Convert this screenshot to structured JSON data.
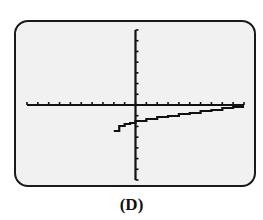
{
  "figure": {
    "caption": "(D)",
    "screen_background": "#f1f1f1",
    "frame_color": "#1a1a1a",
    "ink_color": "#111111"
  },
  "chart_data": {
    "type": "line",
    "title": "",
    "xlabel": "",
    "ylabel": "",
    "grid": false,
    "axes": {
      "x_ticks_count": 21,
      "y_ticks_count": 15,
      "xlim": [
        -10,
        10
      ],
      "ylim": [
        -7,
        7
      ]
    },
    "series": [
      {
        "name": "y = f(x) (logarithmic-shaped, step-rendered)",
        "x": [
          -2,
          -1.5,
          -1,
          -0.5,
          0,
          1,
          2,
          3,
          4,
          5,
          6,
          7,
          8,
          9,
          10
        ],
        "y": [
          -2.4,
          -2.0,
          -1.8,
          -1.65,
          -1.5,
          -1.3,
          -1.15,
          -1.0,
          -0.85,
          -0.7,
          -0.55,
          -0.45,
          -0.3,
          -0.2,
          -0.15
        ]
      }
    ]
  }
}
